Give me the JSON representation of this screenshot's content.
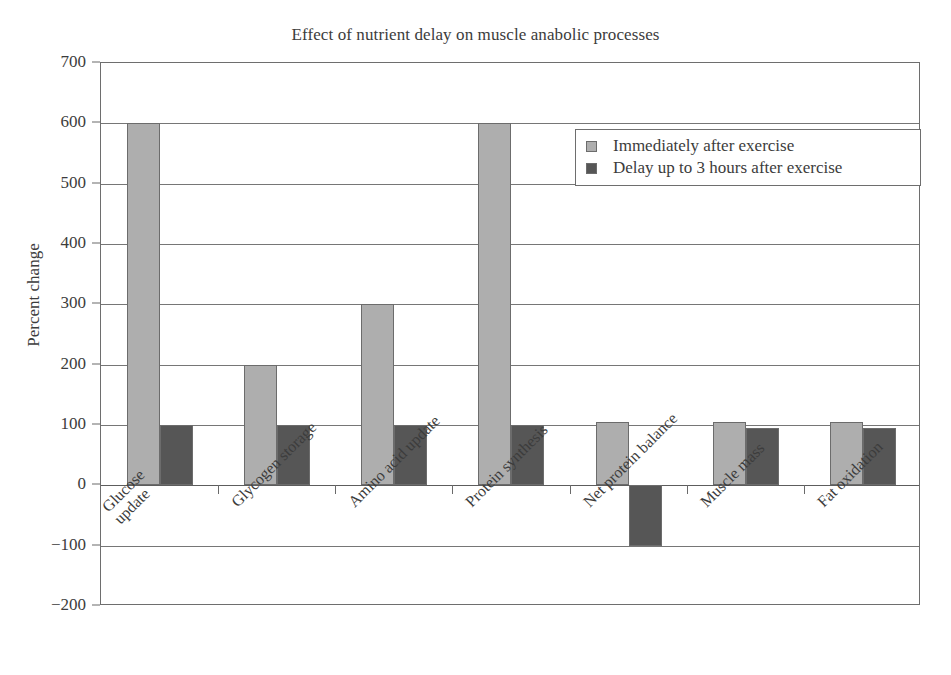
{
  "chart_data": {
    "type": "bar",
    "title": "Effect of nutrient delay on muscle anabolic processes",
    "xlabel": "",
    "ylabel": "Percent change",
    "ylim": [
      -200,
      700
    ],
    "ytick_step": 100,
    "yticks": [
      700,
      600,
      500,
      400,
      300,
      200,
      100,
      0,
      -100,
      -200
    ],
    "ytick_labels": [
      "700",
      "600",
      "500",
      "400",
      "300",
      "200",
      "100",
      "0",
      "−100",
      "−200"
    ],
    "grid": true,
    "grid_axis": "y",
    "legend_position": "upper right",
    "categories": [
      "Glucose update",
      "Glycogen storage",
      "Amino acid update",
      "Protein synthesis",
      "Net protein balance",
      "Muscle mass",
      "Fat oxidation"
    ],
    "category_lines": [
      [
        "Glucose",
        "update"
      ],
      [
        "Glycogen storage"
      ],
      [
        "Amino acid update"
      ],
      [
        "Protein synthesis"
      ],
      [
        "Net protein balance"
      ],
      [
        "Muscle mass"
      ],
      [
        "Fat oxidation"
      ]
    ],
    "series": [
      {
        "name": "Immediately after exercise",
        "color": "#aeaeae",
        "values": [
          600,
          200,
          300,
          600,
          105,
          105,
          105
        ]
      },
      {
        "name": "Delay up to 3 hours after exercise",
        "color": "#565656",
        "values": [
          100,
          100,
          100,
          100,
          -100,
          95,
          95
        ]
      }
    ]
  },
  "colors": {
    "series_light": "#aeaeae",
    "series_dark": "#565656",
    "axis": "#6e6e6e",
    "grid": "#767676",
    "text": "#3c3c3c",
    "background": "#ffffff"
  }
}
